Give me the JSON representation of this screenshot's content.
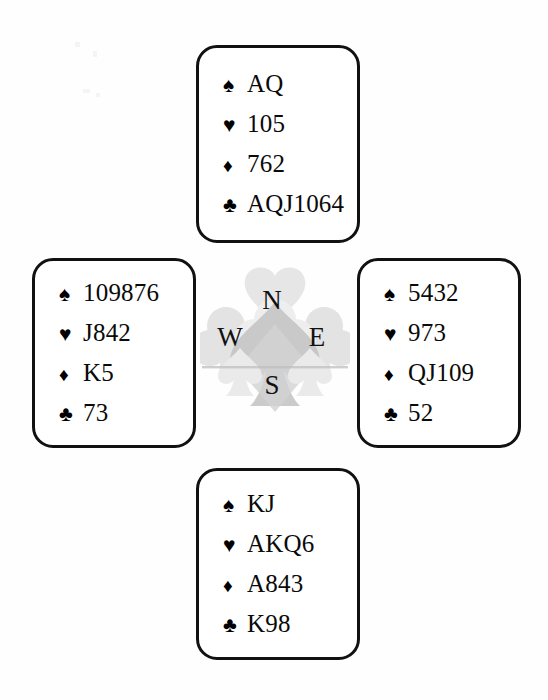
{
  "diagram": {
    "type": "bridge-hand-diagram",
    "background_color": "#fefefe",
    "border_color": "#111111",
    "text_color": "#0a0a0a",
    "watermark_color": "#d9d9d9"
  },
  "suits": {
    "spade": {
      "name": "spade",
      "glyph": "♠"
    },
    "heart": {
      "name": "heart",
      "glyph": "♥"
    },
    "diamond": {
      "name": "diamond",
      "glyph": "♦"
    },
    "club": {
      "name": "club",
      "glyph": "♣"
    }
  },
  "compass": {
    "north": "N",
    "west": "W",
    "east": "E",
    "south": "S"
  },
  "hands": {
    "north": {
      "position": "North",
      "spades": "AQ",
      "hearts": "105",
      "diamonds": "762",
      "clubs": "AQJ1064"
    },
    "west": {
      "position": "West",
      "spades": "109876",
      "hearts": "J842",
      "diamonds": "K5",
      "clubs": "73"
    },
    "east": {
      "position": "East",
      "spades": "5432",
      "hearts": "973",
      "diamonds": "QJ109",
      "clubs": "52"
    },
    "south": {
      "position": "South",
      "spades": "KJ",
      "hearts": "AKQ6",
      "diamonds": "A843",
      "clubs": "K98"
    }
  }
}
